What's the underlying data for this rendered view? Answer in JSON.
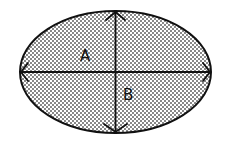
{
  "diagram": {
    "type": "ellipse-with-axes",
    "labels": {
      "a": "A",
      "b": "B"
    },
    "colors": {
      "outline": "#111111",
      "fill_dots": "#555555",
      "background": "#ffffff"
    }
  }
}
